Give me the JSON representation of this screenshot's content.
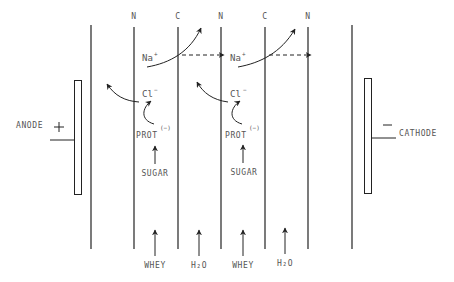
{
  "diagram": {
    "type": "electrodialysis-cell",
    "electrodes": {
      "anode": {
        "label": "ANODE",
        "sign": "+"
      },
      "cathode": {
        "label": "CATHODE",
        "sign": "—"
      }
    },
    "membrane_labels": [
      "N",
      "C",
      "N",
      "C",
      "N"
    ],
    "ions": {
      "na": "Na",
      "na_charge": "+",
      "cl": "Cl",
      "cl_charge": "−",
      "prot": "PROT",
      "prot_charge": "(−)",
      "sugar": "SUGAR"
    },
    "streams": [
      "WHEY",
      "H₂O",
      "WHEY",
      "H₂O"
    ],
    "colors": {
      "line": "#222222",
      "text": "#555555",
      "background": "#ffffff"
    }
  }
}
